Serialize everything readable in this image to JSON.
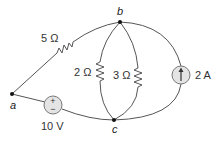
{
  "diagram": {
    "type": "circuit",
    "nodes": [
      {
        "id": "a",
        "label": "a"
      },
      {
        "id": "b",
        "label": "b"
      },
      {
        "id": "c",
        "label": "c"
      }
    ],
    "components": {
      "r1": {
        "type": "resistor",
        "label": "5 Ω",
        "between": [
          "a",
          "b"
        ]
      },
      "r2": {
        "type": "resistor",
        "label": "2 Ω",
        "between": [
          "b",
          "c"
        ]
      },
      "r3": {
        "type": "resistor",
        "label": "3 Ω",
        "between": [
          "b",
          "c"
        ]
      },
      "vs": {
        "type": "voltage-source",
        "label": "10 V",
        "between": [
          "a",
          "c"
        ],
        "plus_symbol": "+",
        "minus_symbol": "−"
      },
      "is": {
        "type": "current-source",
        "label": "2 A",
        "between": [
          "c",
          "b"
        ],
        "direction": "up"
      }
    }
  }
}
